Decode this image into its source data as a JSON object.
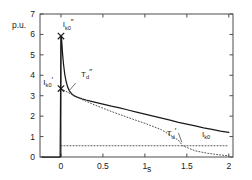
{
  "chart_data": {
    "type": "line",
    "title": "",
    "xlabel": "s",
    "ylabel": "p.u.",
    "xlim": [
      -0.25,
      2.05
    ],
    "ylim": [
      0,
      7
    ],
    "grid": false,
    "legend": "none",
    "xticks": [
      "0",
      "0.5",
      "1",
      "1.5",
      "2"
    ],
    "xtick_values": [
      0,
      0.5,
      1,
      1.5,
      2
    ],
    "yticks": [
      "0",
      "1",
      "2",
      "3",
      "4",
      "5",
      "6",
      "7"
    ],
    "ytick_values": [
      0,
      1,
      2,
      3,
      4,
      5,
      6,
      7
    ],
    "series": [
      {
        "name": "short-circuit current",
        "style": "solid",
        "color": "#1a1a1a",
        "x": [
          -0.22,
          -0.14,
          -0.06,
          -0.01,
          0.0,
          0.005,
          0.01,
          0.02,
          0.03,
          0.045,
          0.06,
          0.08,
          0.1,
          0.13,
          0.16,
          0.2,
          0.25,
          0.3,
          0.35,
          0.4,
          0.5,
          0.6,
          0.7,
          0.8,
          0.9,
          1.0,
          1.1,
          1.2,
          1.3,
          1.4,
          1.5,
          1.6,
          1.7,
          1.8,
          1.9,
          2.0
        ],
        "y": [
          0.0,
          0.0,
          0.0,
          0.0,
          5.92,
          5.9,
          5.6,
          5.0,
          4.55,
          4.05,
          3.72,
          3.42,
          3.24,
          3.08,
          2.99,
          2.92,
          2.85,
          2.79,
          2.74,
          2.69,
          2.59,
          2.49,
          2.4,
          2.3,
          2.2,
          2.1,
          2.0,
          1.9,
          1.8,
          1.7,
          1.61,
          1.52,
          1.43,
          1.35,
          1.27,
          1.2
        ]
      },
      {
        "name": "transient envelope tangent",
        "style": "dotted",
        "color": "#555555",
        "x": [
          0.0,
          0.2,
          0.4,
          0.6,
          0.8,
          1.0,
          1.2,
          1.4,
          1.45,
          1.6,
          1.75,
          1.9,
          2.0
        ],
        "y": [
          3.35,
          2.9,
          2.55,
          2.23,
          1.93,
          1.65,
          1.33,
          0.82,
          0.55,
          0.3,
          0.18,
          0.1,
          0.06
        ]
      },
      {
        "name": "steady-state level",
        "style": "dotted-horizontal",
        "color": "#555555",
        "x": [
          0.0,
          2.0
        ],
        "y": [
          0.55,
          0.55
        ]
      },
      {
        "name": "fault instant vertical",
        "style": "solid-thin",
        "color": "#1a1a1a",
        "x": [
          0.0,
          0.0
        ],
        "y": [
          0.0,
          5.92
        ]
      }
    ],
    "markers": [
      {
        "label": "Ik0''",
        "x": 0.0,
        "y": 5.92,
        "symbol": "x"
      },
      {
        "label": "Ik0'",
        "x": 0.0,
        "y": 3.35,
        "symbol": "x"
      }
    ],
    "annotations": [
      {
        "id": "i-subtransient",
        "base": "I",
        "sub": "k0",
        "prime": "″",
        "x": 0.02,
        "y": 6.35,
        "note": "subtransient short-circuit current"
      },
      {
        "id": "i-transient",
        "base": "I",
        "sub": "k0",
        "prime": "′",
        "x": -0.21,
        "y": 3.52,
        "note": "transient short-circuit current"
      },
      {
        "id": "t-subtransient",
        "base": "T",
        "sub": "d",
        "prime": "″",
        "x": 0.24,
        "y": 3.92,
        "note": "subtransient time constant"
      },
      {
        "id": "t-transient",
        "base": "T",
        "sub": "d",
        "prime": "′",
        "x": 1.26,
        "y": 1.02,
        "note": "transient time constant"
      },
      {
        "id": "i-steady",
        "base": "I",
        "sub": "k0",
        "prime": "",
        "x": 1.68,
        "y": 0.98,
        "note": "steady-state short-circuit current"
      }
    ]
  },
  "axes": {
    "y_unit_label": "p.u.",
    "x_unit_label": "s"
  },
  "colors": {
    "foreground": "#1a1a1a",
    "dotted": "#555555",
    "background": "#ffffff",
    "frame": "#4d4d4d"
  }
}
